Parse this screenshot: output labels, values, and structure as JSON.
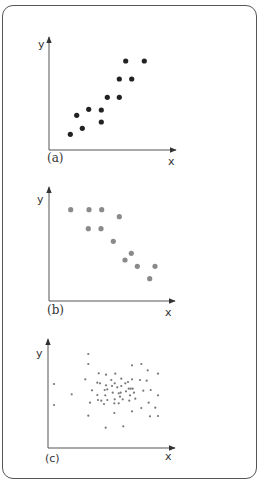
{
  "chart_data": [
    {
      "type": "scatter",
      "label": "(a)",
      "xlabel": "x",
      "ylabel": "y",
      "description": "positive correlation",
      "dot_color": "#222222",
      "dot_radius": 2.6,
      "axis": {
        "x0": 49,
        "y0": 150,
        "x_end": 176,
        "y_top": 37
      },
      "label_pos": {
        "caption": [
          47,
          162
        ],
        "xlab": [
          168,
          165
        ],
        "ylab": [
          38,
          48
        ]
      },
      "points": [
        [
          70.3,
          134.3
        ],
        [
          76.7,
          115.3
        ],
        [
          82.3,
          128.3
        ],
        [
          88.7,
          109.3
        ],
        [
          101.3,
          110
        ],
        [
          101.3,
          122
        ],
        [
          107.3,
          97.3
        ],
        [
          119.3,
          97.3
        ],
        [
          119.3,
          79
        ],
        [
          131.7,
          79
        ],
        [
          125.7,
          61
        ],
        [
          144.3,
          61
        ]
      ]
    },
    {
      "type": "scatter",
      "label": "(b)",
      "xlabel": "x",
      "ylabel": "y",
      "description": "negative correlation",
      "dot_color": "#8a8a8a",
      "dot_radius": 2.6,
      "axis": {
        "x0": 49,
        "y0": 301,
        "x_end": 175,
        "y_top": 187
      },
      "label_pos": {
        "caption": [
          47,
          314
        ],
        "xlab": [
          165,
          316
        ],
        "ylab": [
          37,
          203
        ]
      },
      "points": [
        [
          70.7,
          209.7
        ],
        [
          89,
          209.7
        ],
        [
          101.7,
          209.7
        ],
        [
          119.3,
          216.7
        ],
        [
          88.3,
          228.7
        ],
        [
          101,
          228.7
        ],
        [
          113.3,
          241.3
        ],
        [
          131.3,
          253.3
        ],
        [
          125,
          260
        ],
        [
          137.3,
          266.3
        ],
        [
          155,
          266.3
        ],
        [
          149.7,
          278.7
        ]
      ]
    },
    {
      "type": "scatter",
      "label": "(c)",
      "xlabel": "x",
      "ylabel": "y",
      "description": "no correlation",
      "dot_color": "#777777",
      "dot_radius": 1.1,
      "axis": {
        "x0": 48,
        "y0": 448,
        "x_end": 175,
        "y_top": 339
      },
      "label_pos": {
        "caption": [
          45,
          462
        ],
        "xlab": [
          165,
          460
        ],
        "ylab": [
          36,
          357
        ]
      },
      "points": [
        [
          88.3,
          354
        ],
        [
          88.3,
          364
        ],
        [
          54,
          384
        ],
        [
          54,
          405
        ],
        [
          71.7,
          394.3
        ],
        [
          85.3,
          379.3
        ],
        [
          88.3,
          415.7
        ],
        [
          90,
          402.7
        ],
        [
          92,
          390.3
        ],
        [
          98.7,
          373.3
        ],
        [
          97.3,
          382.7
        ],
        [
          100,
          383.3
        ],
        [
          97.3,
          395
        ],
        [
          98,
          400
        ],
        [
          101.3,
          400.7
        ],
        [
          104,
          404
        ],
        [
          106,
          374.7
        ],
        [
          106,
          385.3
        ],
        [
          104.7,
          390
        ],
        [
          107.3,
          389.3
        ],
        [
          105.3,
          395.3
        ],
        [
          107.3,
          400
        ],
        [
          105.7,
          427.7
        ],
        [
          111.3,
          380
        ],
        [
          112,
          386
        ],
        [
          112.7,
          392.7
        ],
        [
          115.3,
          373.7
        ],
        [
          114.7,
          383.3
        ],
        [
          114.7,
          399.3
        ],
        [
          114.3,
          403.3
        ],
        [
          114.3,
          413
        ],
        [
          117.3,
          387.3
        ],
        [
          118.7,
          393.3
        ],
        [
          120,
          396.7
        ],
        [
          118.7,
          403.3
        ],
        [
          121.3,
          378.7
        ],
        [
          121.3,
          386
        ],
        [
          120.7,
          392.7
        ],
        [
          122.7,
          399.3
        ],
        [
          123.3,
          426.3
        ],
        [
          125.3,
          383.3
        ],
        [
          126,
          391.3
        ],
        [
          128,
          382
        ],
        [
          128.7,
          388.7
        ],
        [
          130.7,
          388.7
        ],
        [
          130,
          395.3
        ],
        [
          129.3,
          400.7
        ],
        [
          132.7,
          388.7
        ],
        [
          132,
          379.3
        ],
        [
          134,
          392.7
        ],
        [
          132,
          365.3
        ],
        [
          132,
          411.3
        ],
        [
          135.3,
          398.7
        ],
        [
          141.3,
          364
        ],
        [
          140,
          380
        ],
        [
          143.3,
          390.7
        ],
        [
          141.3,
          408
        ],
        [
          146.7,
          380.7
        ],
        [
          147.7,
          370.3
        ],
        [
          148.7,
          402.7
        ],
        [
          150.7,
          390
        ],
        [
          150,
          416.3
        ],
        [
          155.3,
          407.7
        ],
        [
          158,
          373.7
        ],
        [
          158,
          395.3
        ],
        [
          158,
          416
        ]
      ]
    }
  ],
  "captions": {
    "a": "(a)",
    "b": "(b)",
    "c": "(c)"
  },
  "axis_labels": {
    "x": "x",
    "y": "y"
  }
}
